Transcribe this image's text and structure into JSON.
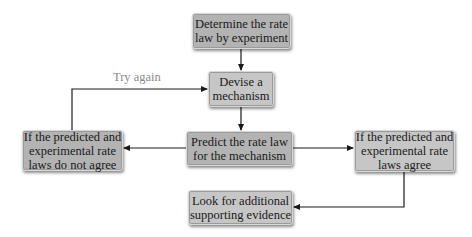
{
  "diagram": {
    "type": "flowchart",
    "nodes": {
      "determine": {
        "lines": [
          "Determine the rate",
          "law by experiment"
        ]
      },
      "devise": {
        "lines": [
          "Devise a",
          "mechanism"
        ]
      },
      "predict": {
        "lines": [
          "Predict the rate law",
          "for the mechanism"
        ]
      },
      "disagree": {
        "lines": [
          "If the predicted and",
          "experimental rate",
          "laws do not agree"
        ]
      },
      "agree": {
        "lines": [
          "If the predicted and",
          "experimental rate",
          "laws agree"
        ]
      },
      "evidence": {
        "lines": [
          "Look for additional",
          "supporting evidence"
        ]
      }
    },
    "edges": [
      {
        "from": "determine",
        "to": "devise",
        "label": ""
      },
      {
        "from": "devise",
        "to": "predict",
        "label": ""
      },
      {
        "from": "predict",
        "to": "disagree",
        "label": ""
      },
      {
        "from": "predict",
        "to": "agree",
        "label": ""
      },
      {
        "from": "disagree",
        "to": "devise",
        "label": "Try again"
      },
      {
        "from": "agree",
        "to": "evidence",
        "label": ""
      }
    ],
    "try_again_label": "Try again",
    "colors": {
      "box_fill": "#b3b3b3",
      "box_fill_light": "#c6c6c6",
      "line": "#1a1a1a",
      "label_text": "#8a8a8a"
    }
  }
}
